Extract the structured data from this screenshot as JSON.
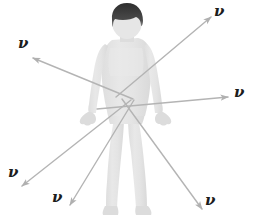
{
  "figure": {
    "background_color": "#ffffff",
    "width": 256,
    "height": 222
  },
  "body_figure": {
    "name": "human-body-silhouette",
    "skin_color": "#e3e3e3",
    "shade_color": "#d4d4d4",
    "hair_color": "#3a3a3a",
    "outline_color": "#d8d8d8",
    "parts": [
      {
        "label": "hair"
      },
      {
        "label": "head"
      },
      {
        "label": "neck"
      },
      {
        "label": "torso"
      },
      {
        "label": "left-arm"
      },
      {
        "label": "right-arm"
      },
      {
        "label": "left-hand"
      },
      {
        "label": "right-hand"
      },
      {
        "label": "left-leg"
      },
      {
        "label": "right-leg"
      },
      {
        "label": "left-foot"
      },
      {
        "label": "right-foot"
      }
    ]
  },
  "arrow_style": {
    "color": "#b4b4b4",
    "stroke_width": 1.4,
    "head_length": 9,
    "head_width": 5
  },
  "neutrino_arrows": [
    {
      "id": "arrow-upper-right",
      "symbol": "ν",
      "direction": "upper-right",
      "x1": 116,
      "y1": 97,
      "x2": 211,
      "y2": 17,
      "label_x": 214,
      "label_y": 4
    },
    {
      "id": "arrow-upper-left",
      "symbol": "ν",
      "direction": "upper-left",
      "x1": 133,
      "y1": 99,
      "x2": 33,
      "y2": 58,
      "label_x": 18,
      "label_y": 36
    },
    {
      "id": "arrow-right",
      "symbol": "ν",
      "direction": "right",
      "x1": 97,
      "y1": 109,
      "x2": 228,
      "y2": 97,
      "label_x": 234,
      "label_y": 85
    },
    {
      "id": "arrow-lower-left-far",
      "symbol": "ν",
      "direction": "lower-left",
      "x1": 131,
      "y1": 100,
      "x2": 22,
      "y2": 186,
      "label_x": 8,
      "label_y": 165
    },
    {
      "id": "arrow-lower-left-near",
      "symbol": "ν",
      "direction": "lower-left-steep",
      "x1": 134,
      "y1": 100,
      "x2": 70,
      "y2": 205,
      "label_x": 52,
      "label_y": 190
    },
    {
      "id": "arrow-lower-right",
      "symbol": "ν",
      "direction": "lower-right",
      "x1": 122,
      "y1": 99,
      "x2": 202,
      "y2": 209,
      "label_x": 205,
      "label_y": 193
    }
  ]
}
